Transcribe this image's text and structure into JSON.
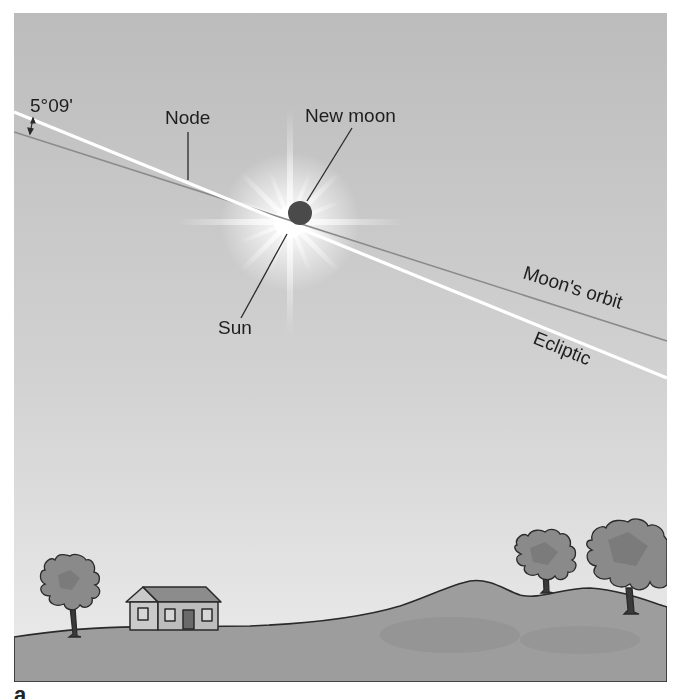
{
  "figure": {
    "letter": "a",
    "labels": {
      "inclination": "5°09'",
      "node": "Node",
      "new_moon": "New moon",
      "sun": "Sun",
      "moon_orbit": "Moon's orbit",
      "ecliptic": "Ecliptic"
    },
    "colors": {
      "sky_top": "#bdbdbd",
      "sky_bottom": "#ebebeb",
      "ground": "#9e9e9e",
      "ground_shadow": "#8e8e8e",
      "outline": "#2a2a2a",
      "ecliptic": "#ffffff",
      "moon_orbit": "#8a8a8a",
      "moon": "#4a4a4a",
      "house_wall": "#c8c8c8",
      "house_roof": "#8c8c8c",
      "house_door": "#6a6a6a",
      "tree_foliage": "#8a8a8a",
      "tree_trunk": "#3a3a3a"
    }
  }
}
